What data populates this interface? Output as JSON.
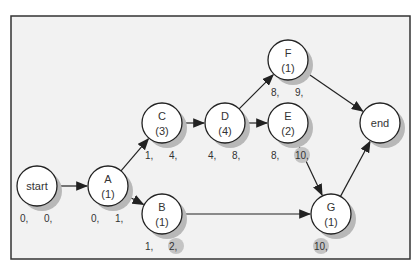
{
  "diagram": {
    "type": "activity-on-node network",
    "nodes": [
      {
        "id": "start",
        "label": "start",
        "duration": "",
        "cx": 37,
        "cy": 186,
        "times": [
          "0,",
          "0,"
        ]
      },
      {
        "id": "A",
        "label": "A",
        "duration": "(1)",
        "cx": 108,
        "cy": 186,
        "times": [
          "0,",
          "1,"
        ]
      },
      {
        "id": "C",
        "label": "C",
        "duration": "(3)",
        "cx": 162,
        "cy": 123,
        "times": [
          "1,",
          "4,"
        ]
      },
      {
        "id": "D",
        "label": "D",
        "duration": "(4)",
        "cx": 225,
        "cy": 123,
        "times": [
          "4,",
          "8,"
        ]
      },
      {
        "id": "F",
        "label": "F",
        "duration": "(1)",
        "cx": 288,
        "cy": 60,
        "times": [
          "8,",
          "9,"
        ]
      },
      {
        "id": "E",
        "label": "E",
        "duration": "(2)",
        "cx": 288,
        "cy": 123,
        "times": [
          "8,",
          "10,"
        ]
      },
      {
        "id": "end",
        "label": "end",
        "duration": "",
        "cx": 380,
        "cy": 123,
        "times": []
      },
      {
        "id": "B",
        "label": "B",
        "duration": "(1)",
        "cx": 162,
        "cy": 214,
        "times": [
          "1,",
          "2,"
        ]
      },
      {
        "id": "G",
        "label": "G",
        "duration": "(1)",
        "cx": 331,
        "cy": 214,
        "times": [
          "10,"
        ]
      }
    ],
    "edges": [
      [
        "start",
        "A"
      ],
      [
        "A",
        "C"
      ],
      [
        "A",
        "B"
      ],
      [
        "C",
        "D"
      ],
      [
        "D",
        "F"
      ],
      [
        "D",
        "E"
      ],
      [
        "F",
        "end"
      ],
      [
        "E",
        "G"
      ],
      [
        "B",
        "G"
      ],
      [
        "G",
        "end"
      ]
    ],
    "highlighted_times": [
      "B:2,",
      "E:10,",
      "G:10,"
    ],
    "colors": {
      "background": "#f2f2f2",
      "node_fill": "#ffffff",
      "shadow": "#b8b8b8",
      "stroke": "#222222",
      "highlight": "#c4c4c4"
    }
  }
}
